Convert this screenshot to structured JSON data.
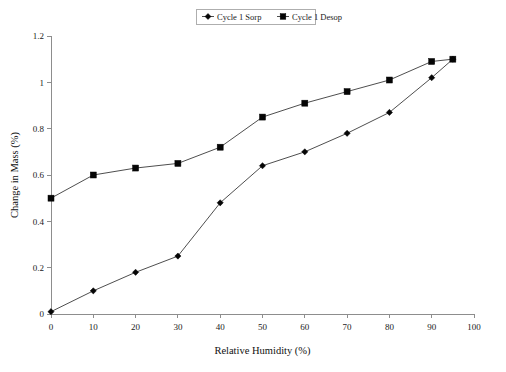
{
  "chart_data": {
    "type": "line",
    "title": "",
    "xlabel": "Relative Humidity (%)",
    "ylabel": "Change in Mass (%)",
    "xlim": [
      0,
      100
    ],
    "ylim": [
      0,
      1.2
    ],
    "xticks": [
      "0",
      "10",
      "20",
      "30",
      "40",
      "50",
      "60",
      "70",
      "80",
      "90",
      "100"
    ],
    "yticks": [
      "0",
      "0.2",
      "0.4",
      "0.6",
      "0.8",
      "1",
      "1.2"
    ],
    "grid": false,
    "legend_position": "top-center",
    "series": [
      {
        "name": "Cycle 1  Sorp",
        "marker": "diamond",
        "color": "#050505",
        "x": [
          0,
          10,
          20,
          30,
          40,
          50,
          60,
          70,
          80,
          90,
          95
        ],
        "values": [
          0.01,
          0.1,
          0.18,
          0.25,
          0.48,
          0.64,
          0.7,
          0.78,
          0.87,
          1.02,
          1.1
        ]
      },
      {
        "name": "Cycle 1  Desop",
        "marker": "square",
        "color": "#050505",
        "x": [
          0,
          10,
          20,
          30,
          40,
          50,
          60,
          70,
          80,
          90,
          95
        ],
        "values": [
          0.5,
          0.6,
          0.63,
          0.65,
          0.72,
          0.85,
          0.91,
          0.96,
          1.01,
          1.09,
          1.1
        ]
      }
    ]
  },
  "legend": {
    "entries": [
      {
        "label": "Cycle 1  Sorp",
        "marker": "diamond"
      },
      {
        "label": "Cycle 1  Desop",
        "marker": "square"
      }
    ]
  }
}
